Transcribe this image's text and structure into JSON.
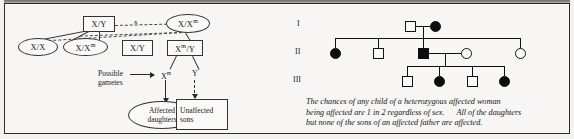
{
  "figure": {
    "type": "x-linked-dominant-inheritance",
    "left_panel": {
      "title_absent": true,
      "cross_symbol": "x",
      "parents": [
        {
          "id": "father",
          "genotype": "X/Y",
          "shape": "square",
          "sex": "male",
          "affected": false
        },
        {
          "id": "mother",
          "genotype": "X/Xᵐ",
          "genotype_base": "X/X",
          "genotype_sup": "m",
          "shape": "oval",
          "sex": "female",
          "affected": true
        }
      ],
      "offspring": [
        {
          "id": "daughter-unaffected",
          "genotype": "X/X",
          "shape": "oval",
          "sex": "female",
          "affected": false
        },
        {
          "id": "daughter-affected",
          "genotype_base": "X/X",
          "genotype_sup": "m",
          "shape": "oval",
          "sex": "female",
          "affected": true
        },
        {
          "id": "son-unaffected",
          "genotype": "X/Y",
          "shape": "square",
          "sex": "male",
          "affected": false
        },
        {
          "id": "son-affected",
          "genotype_base": "X",
          "genotype_sup": "m",
          "genotype_tail": "/Y",
          "shape": "square",
          "sex": "male",
          "affected": true
        }
      ],
      "gametes_label_line1": "Possible",
      "gametes_label_line2": "gametes",
      "gamete_1_base": "X",
      "gamete_1_sup": "m",
      "gamete_2": "Y",
      "outcome_affected_line1": "Affected",
      "outcome_affected_line2": "daughters",
      "outcome_unaffected_line1": "Unaffected",
      "outcome_unaffected_line2": "sons"
    },
    "right_panel": {
      "generations": [
        {
          "label": "I",
          "individuals": [
            {
              "shape": "square",
              "sex": "male",
              "affected": false
            },
            {
              "shape": "circle",
              "sex": "female",
              "affected": true
            }
          ]
        },
        {
          "label": "II",
          "individuals": [
            {
              "shape": "circle",
              "sex": "female",
              "affected": true
            },
            {
              "shape": "square",
              "sex": "male",
              "affected": false
            },
            {
              "shape": "square",
              "sex": "male",
              "affected": true
            },
            {
              "shape": "circle",
              "sex": "female",
              "affected": false
            },
            {
              "shape": "circle",
              "sex": "female",
              "affected": false
            }
          ]
        },
        {
          "label": "III",
          "individuals": [
            {
              "shape": "square",
              "sex": "male",
              "affected": false
            },
            {
              "shape": "circle",
              "sex": "female",
              "affected": true
            },
            {
              "shape": "square",
              "sex": "male",
              "affected": false
            },
            {
              "shape": "circle",
              "sex": "female",
              "affected": true
            }
          ]
        }
      ],
      "caption_line1": "The chances of any child of a heterozygous affected  woman",
      "caption_line2a": "being affected are 1 in 2 regardless of sex.",
      "caption_line2b": "All of the daughters",
      "caption_line3": "but none of the sons of an  affected father are affected."
    },
    "colors": {
      "ink": "#1a1a1a",
      "affected_fill": "#0d0d0d",
      "unaffected_fill": "#fdfcfa",
      "page": "#f7f6f4",
      "border": "#2b2b2b"
    }
  }
}
